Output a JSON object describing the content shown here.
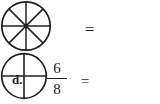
{
  "background_color": "#ffffff",
  "ink_color": "#231f20",
  "figure": {
    "left_circle": {
      "name": "circle-divided-eighths",
      "parts": 8,
      "shaded_parts": 0,
      "description": "circle divided into 8 equal sectors, unshaded",
      "center_dot": true
    },
    "relation_symbol": "=",
    "right_circle": {
      "name": "circle-divided-fourths",
      "parts": 4,
      "shaded_parts": 0,
      "description": "circle divided into 4 equal quarters by one vertical and one horizontal diameter"
    }
  },
  "answer_row": {
    "item_letter": "d.",
    "fraction": {
      "numerator": "6",
      "denominator": "8"
    },
    "equals": "=",
    "answer_value": ""
  }
}
